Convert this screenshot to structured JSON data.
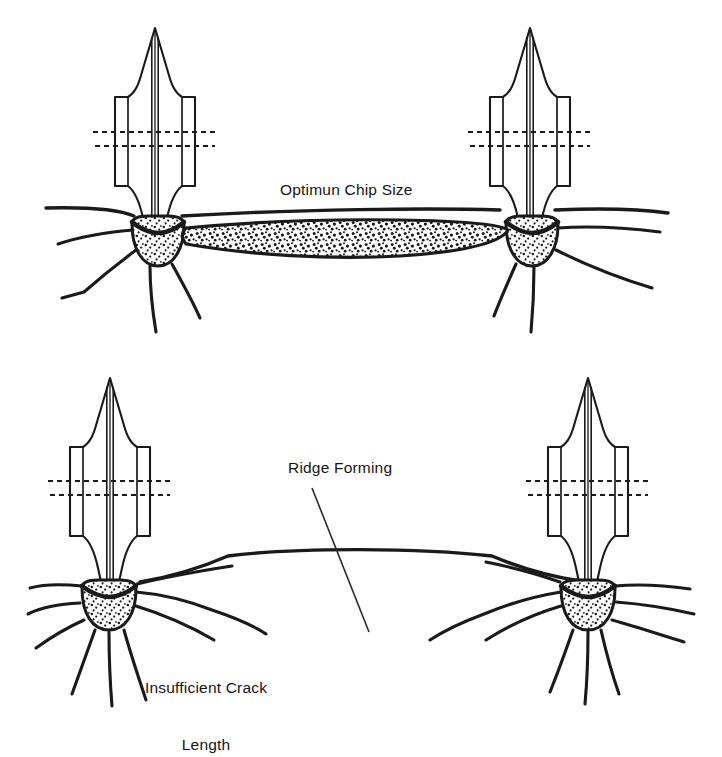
{
  "figure": {
    "type": "technical-line-diagram",
    "background_color": "#ffffff",
    "ink_color": "#1a1a1a"
  },
  "labels": {
    "optimum_chip": "Optimun Chip Size",
    "ridge_forming": "Ridge Forming",
    "insufficient_crack_line1": "Insufficient Crack",
    "insufficient_crack_line2": "Length"
  },
  "panels": [
    {
      "id": "top",
      "name": "optimum-chip-panel",
      "caption": "Optimun Chip Size",
      "description": "Two indenters spaced so their radial cracks link, forming one continuous stippled chip between them.",
      "indenters": 2,
      "chip_present": true,
      "ridge_present": false
    },
    {
      "id": "bottom",
      "name": "insufficient-crack-panel",
      "caption": "Insufficient Crack Length",
      "description": "Two indenters spaced too far apart; radial cracks do not meet and an uncut ridge remains between them.",
      "indenters": 2,
      "chip_present": false,
      "ridge_present": true
    }
  ],
  "indenter": {
    "name": "wedge-indenter",
    "parts": [
      "pointed-tip",
      "flared-shoulder",
      "rectangular-body",
      "tapered-shank",
      "center-axis-lines"
    ],
    "dashed_guide_lines": 2
  },
  "crushed_zone": {
    "name": "crushed-zone",
    "fill": "stipple",
    "shape": "bowl"
  }
}
